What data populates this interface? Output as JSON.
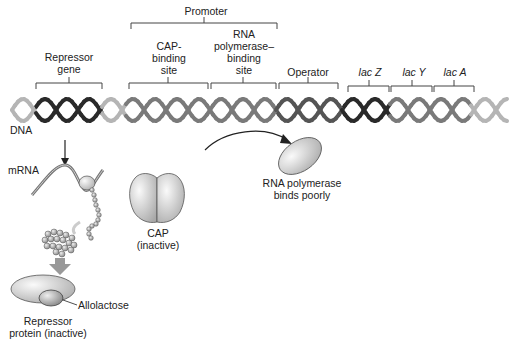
{
  "diagram": {
    "dna_label": "DNA",
    "regions": {
      "promoter": "Promoter",
      "repressor_gene": [
        "Repressor",
        "gene"
      ],
      "cap_binding_site": [
        "CAP-",
        "binding",
        "site"
      ],
      "rna_polymerase_binding_site": [
        "RNA",
        "polymerase–",
        "binding",
        "site"
      ],
      "operator": "Operator",
      "lac_z": "lac Z",
      "lac_y": "lac Y",
      "lac_a": "lac A"
    },
    "mrna_label": "mRNA",
    "cap": [
      "CAP",
      "(inactive)"
    ],
    "rna_polymerase": [
      "RNA polymerase",
      "binds poorly"
    ],
    "allolactose": "Allolactose",
    "repressor_protein": [
      "Repressor",
      "protein (inactive)"
    ],
    "colors": {
      "strand_light": "#b5b5b5",
      "strand_mid": "#7a7a7a",
      "strand_dark": "#2a2a2a",
      "bracket": "#444444",
      "protein_fill": "#d9d9d9"
    }
  }
}
